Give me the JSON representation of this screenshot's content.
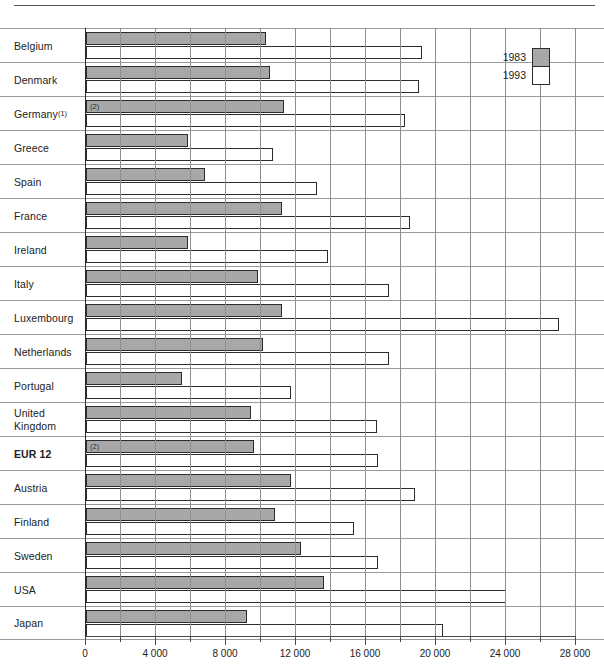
{
  "legend": {
    "entries": [
      {
        "label": "1983",
        "color": "#a8a8a8"
      },
      {
        "label": "1993",
        "color": "#ffffff"
      }
    ]
  },
  "axis": {
    "tick_labels": [
      "0",
      "4 000",
      "8 000",
      "12 000",
      "16 000",
      "20 000",
      "24 000",
      "28 000"
    ]
  },
  "notes": {
    "germany_label_sup": "(1)",
    "germany_bar_note": "(2)",
    "eur12_bar_note": "(2)"
  },
  "chart_data": {
    "type": "bar",
    "orientation": "horizontal",
    "title": "",
    "subtitle": "",
    "xlabel": "",
    "ylabel": "",
    "xlim": [
      0,
      28000
    ],
    "xticks": [
      0,
      4000,
      8000,
      12000,
      16000,
      20000,
      24000,
      28000
    ],
    "minor_tick_step": 2000,
    "grid": true,
    "legend_position": "top-right",
    "categories": [
      "Belgium",
      "Denmark",
      "Germany",
      "Greece",
      "Spain",
      "France",
      "Ireland",
      "Italy",
      "Luxembourg",
      "Netherlands",
      "Portugal",
      "United Kingdom",
      "EUR 12",
      "Austria",
      "Finland",
      "Sweden",
      "USA",
      "Japan"
    ],
    "series": [
      {
        "name": "1983",
        "color": "#a8a8a8",
        "values": [
          10300,
          10500,
          11300,
          5800,
          6800,
          11200,
          5800,
          9800,
          11200,
          10100,
          5500,
          9400,
          9600,
          11700,
          10800,
          12300,
          13600,
          9200
        ]
      },
      {
        "name": "1993",
        "color": "#ffffff",
        "values": [
          19200,
          19000,
          18200,
          10700,
          13200,
          18500,
          13800,
          17300,
          27000,
          17300,
          11700,
          16600,
          16700,
          18800,
          15300,
          16700,
          24000,
          20400
        ]
      }
    ]
  },
  "rows": [
    {
      "label": "Belgium",
      "sup": "",
      "bold": false,
      "two_line": false,
      "note": ""
    },
    {
      "label": "Denmark",
      "sup": "",
      "bold": false,
      "two_line": false,
      "note": ""
    },
    {
      "label": "Germany",
      "sup": "(1)",
      "bold": false,
      "two_line": false,
      "note": "(2)"
    },
    {
      "label": "Greece",
      "sup": "",
      "bold": false,
      "two_line": false,
      "note": ""
    },
    {
      "label": "Spain",
      "sup": "",
      "bold": false,
      "two_line": false,
      "note": ""
    },
    {
      "label": "France",
      "sup": "",
      "bold": false,
      "two_line": false,
      "note": ""
    },
    {
      "label": "Ireland",
      "sup": "",
      "bold": false,
      "two_line": false,
      "note": ""
    },
    {
      "label": "Italy",
      "sup": "",
      "bold": false,
      "two_line": false,
      "note": ""
    },
    {
      "label": "Luxembourg",
      "sup": "",
      "bold": false,
      "two_line": false,
      "note": ""
    },
    {
      "label": "Netherlands",
      "sup": "",
      "bold": false,
      "two_line": false,
      "note": ""
    },
    {
      "label": "Portugal",
      "sup": "",
      "bold": false,
      "two_line": false,
      "note": ""
    },
    {
      "label": "United Kingdom",
      "sup": "",
      "bold": false,
      "two_line": true,
      "note": ""
    },
    {
      "label": "EUR 12",
      "sup": "",
      "bold": true,
      "two_line": false,
      "note": "(2)"
    },
    {
      "label": "Austria",
      "sup": "",
      "bold": false,
      "two_line": false,
      "note": ""
    },
    {
      "label": "Finland",
      "sup": "",
      "bold": false,
      "two_line": false,
      "note": ""
    },
    {
      "label": "Sweden",
      "sup": "",
      "bold": false,
      "two_line": false,
      "note": ""
    },
    {
      "label": "USA",
      "sup": "",
      "bold": false,
      "two_line": false,
      "note": ""
    },
    {
      "label": "Japan",
      "sup": "",
      "bold": false,
      "two_line": false,
      "note": ""
    }
  ]
}
